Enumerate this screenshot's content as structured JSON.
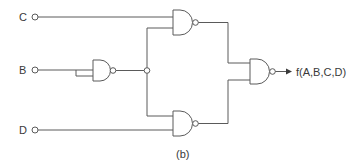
{
  "diagram": {
    "type": "logic-circuit",
    "caption": "(b)",
    "inputs": [
      {
        "id": "C",
        "label": "C"
      },
      {
        "id": "B",
        "label": "B"
      },
      {
        "id": "D",
        "label": "D"
      }
    ],
    "output": {
      "label": "f(A,B,C,D)"
    },
    "gates": [
      {
        "id": "nand1",
        "type": "NAND",
        "inputs": [
          "B",
          "B"
        ],
        "note": "inverter (tied inputs)"
      },
      {
        "id": "nand2",
        "type": "NAND",
        "inputs": [
          "C",
          "nand1"
        ]
      },
      {
        "id": "nand3",
        "type": "NAND",
        "inputs": [
          "nand1",
          "D"
        ]
      },
      {
        "id": "nand4",
        "type": "NAND",
        "inputs": [
          "nand2",
          "nand3"
        ],
        "output": "f(A,B,C,D)"
      }
    ],
    "colors": {
      "line": "#5a5a5a",
      "text": "#3a3a3a",
      "background": "#ffffff"
    }
  }
}
